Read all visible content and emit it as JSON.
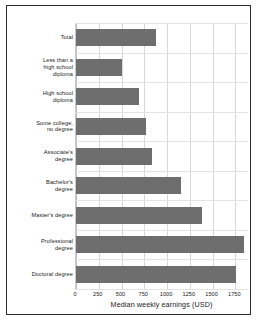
{
  "chart_data": {
    "type": "bar",
    "orientation": "horizontal",
    "title": "",
    "xlabel": "Median weekly earnings (USD)",
    "ylabel": "",
    "xlim": [
      0,
      1900
    ],
    "xticks": [
      0,
      250,
      500,
      750,
      1000,
      1250,
      1500,
      1750
    ],
    "xtick_labels": [
      "0",
      "250",
      "500",
      "750",
      "1000",
      "1250",
      "1500",
      "1750"
    ],
    "grid": true,
    "legend": false,
    "bar_color": "#6e6e6e",
    "categories": [
      "Total",
      "Less than a high school diploma",
      "High school diploma",
      "Some college, no degree",
      "Associate's degree",
      "Bachelor's degree",
      "Master's degree",
      "Professional degree",
      "Doctoral degree"
    ],
    "category_label_lines": [
      [
        "Total"
      ],
      [
        "Less than a",
        "high school",
        "diploma"
      ],
      [
        "High school",
        "diploma"
      ],
      [
        "Some college,",
        "no degree"
      ],
      [
        "Associate's",
        "degree"
      ],
      [
        "Bachelor's",
        "degree"
      ],
      [
        "Master's degree"
      ],
      [
        "Professional",
        "degree"
      ],
      [
        "Doctoral degree"
      ]
    ],
    "values": [
      875,
      500,
      690,
      770,
      830,
      1150,
      1380,
      1840,
      1760
    ]
  }
}
